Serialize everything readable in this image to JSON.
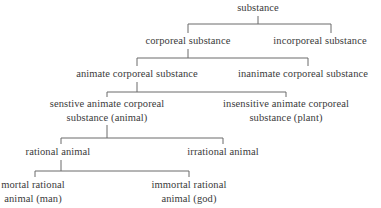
{
  "diagram": {
    "type": "tree",
    "title": "",
    "line_color": "#6b6b6b",
    "text_color": "#3a3a3a",
    "nodes": {
      "root": {
        "lines": [
          "substance"
        ]
      },
      "corporeal": {
        "lines": [
          "corporeal substance"
        ]
      },
      "incorporeal": {
        "lines": [
          "incorporeal substance"
        ]
      },
      "animate": {
        "lines": [
          "animate corporeal substance"
        ]
      },
      "inanimate": {
        "lines": [
          "inanimate corporeal substance"
        ]
      },
      "sensitive": {
        "lines": [
          "senstive animate corporeal",
          "substance (animal)"
        ]
      },
      "insensitive": {
        "lines": [
          "insensitive animate corporeal",
          "substance (plant)"
        ]
      },
      "rational": {
        "lines": [
          "rational animal"
        ]
      },
      "irrational": {
        "lines": [
          "irrational animal"
        ]
      },
      "mortal": {
        "lines": [
          "mortal rational",
          "animal (man)"
        ]
      },
      "immortal": {
        "lines": [
          "immortal rational",
          "animal (god)"
        ]
      }
    },
    "edges": [
      [
        "root",
        "corporeal"
      ],
      [
        "root",
        "incorporeal"
      ],
      [
        "corporeal",
        "animate"
      ],
      [
        "corporeal",
        "inanimate"
      ],
      [
        "animate",
        "sensitive"
      ],
      [
        "animate",
        "insensitive"
      ],
      [
        "sensitive",
        "rational"
      ],
      [
        "sensitive",
        "irrational"
      ],
      [
        "rational",
        "mortal"
      ],
      [
        "rational",
        "immortal"
      ]
    ]
  }
}
